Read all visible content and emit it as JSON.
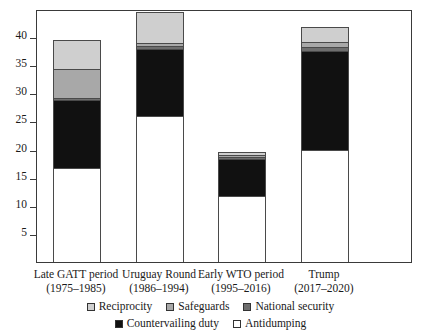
{
  "chart_data": {
    "type": "bar",
    "subtype": "stacked-bar",
    "title": "",
    "xlabel": "",
    "ylabel": "",
    "ylim": [
      0,
      45
    ],
    "yticks": [
      5,
      10,
      15,
      20,
      25,
      30,
      35,
      40
    ],
    "grid": false,
    "legend_position": "bottom",
    "categories": [
      "Late GATT period\n(1975–1985)",
      "Uruguay Round\n(1986–1994)",
      "Early WTO period\n(1995–2016)",
      "Trump\n(2017–2020)"
    ],
    "category_labels": [
      {
        "line1": "Late GATT period",
        "line2": "(1975–1985)"
      },
      {
        "line1": "Uruguay Round",
        "line2": "(1986–1994)"
      },
      {
        "line1": "Early WTO period",
        "line2": "(1995–2016)"
      },
      {
        "line1": "Trump",
        "line2": "(2017–2020)"
      }
    ],
    "series": [
      {
        "name": "Antidumping",
        "color": "#ffffff",
        "values": [
          16.7,
          26.0,
          11.8,
          20.0
        ]
      },
      {
        "name": "Countervailing duty",
        "color": "#111111",
        "values": [
          12.2,
          12.0,
          6.7,
          17.6
        ]
      },
      {
        "name": "National security",
        "color": "#6e6e6e",
        "values": [
          0.3,
          0.5,
          0.3,
          0.8
        ]
      },
      {
        "name": "Safeguards",
        "color": "#a8a8a8",
        "values": [
          5.2,
          0.5,
          0.4,
          0.9
        ]
      },
      {
        "name": "Reciprocity",
        "color": "#cfcfcf",
        "values": [
          5.0,
          5.5,
          0.4,
          2.4
        ]
      }
    ],
    "totals": [
      39.4,
      44.5,
      19.6,
      41.7
    ]
  },
  "legend": {
    "row1": [
      {
        "label": "Reciprocity",
        "swatch": "sw-reciprocity"
      },
      {
        "label": "Safeguards",
        "swatch": "sw-safeguards"
      },
      {
        "label": "National security",
        "swatch": "sw-national-security"
      }
    ],
    "row2": [
      {
        "label": "Countervailing duty",
        "swatch": "sw-countervailing"
      },
      {
        "label": "Antidumping",
        "swatch": "sw-antidumping"
      }
    ]
  },
  "axis": {
    "y_tick_labels": [
      "40",
      "35",
      "30",
      "25",
      "20",
      "15",
      "10",
      "5"
    ]
  }
}
